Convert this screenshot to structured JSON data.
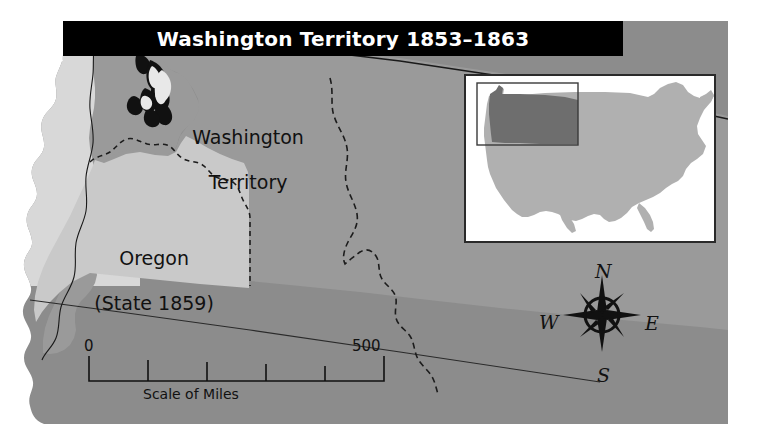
{
  "figure": {
    "kind": "historical-map",
    "width": 761,
    "height": 447
  },
  "title": {
    "text": "Washington Territory 1853–1863",
    "banner_color": "#000000",
    "text_color": "#ffffff"
  },
  "regions": [
    {
      "id": "washington-territory",
      "label_line1": "Washington",
      "label_line2": "Territory",
      "fill": "#9a9a9a"
    },
    {
      "id": "oregon",
      "label_line1": "Oregon",
      "label_line2": "(State 1859)",
      "fill": "#c9c9c9"
    },
    {
      "id": "surrounding-area",
      "label_line1": "",
      "label_line2": "",
      "fill": "#8c8c8c"
    }
  ],
  "labels": {
    "washington": "Washington\nTerritory",
    "oregon": "Oregon\n(State 1859)"
  },
  "scale_bar": {
    "start_label": "0",
    "end_label": "500",
    "caption": "Scale of Miles",
    "segments": 5,
    "units": "miles",
    "max_value": 500
  },
  "compass": {
    "north": "N",
    "east": "E",
    "south": "S",
    "west": "W"
  },
  "inset_map": {
    "description": "United States locator map",
    "background": "#ffffff",
    "country_fill": "#b0b0b0",
    "highlight_fill": "#6e6e6e",
    "locator_box_stroke": "#3a3a3a"
  },
  "colors": {
    "page_background": "#ffffff",
    "map_background": "#8c8c8c",
    "territory": "#9a9a9a",
    "state": "#c9c9c9",
    "ocean_top": "#d8d8d8",
    "banner": "#000000",
    "border_line": "#1a1a1a"
  }
}
